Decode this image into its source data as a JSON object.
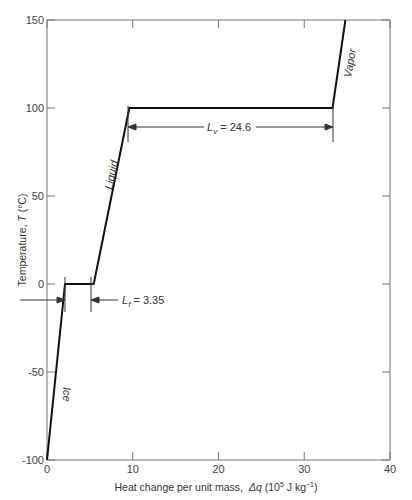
{
  "chart_data": {
    "type": "line",
    "title": "",
    "xlabel": "Heat change per unit mass,  Δq (10⁵ J kg⁻¹)",
    "ylabel": "Temperature, T (°C)",
    "xlim": [
      0,
      40
    ],
    "ylim": [
      -100,
      150
    ],
    "x_ticks": [
      "0",
      "10",
      "20",
      "30",
      "40"
    ],
    "y_ticks": [
      "-100",
      "-50",
      "0",
      "50",
      "100",
      "150"
    ],
    "grid": false,
    "series": [
      {
        "name": "H2O heating curve",
        "x": [
          0,
          2.1,
          5.45,
          9.6,
          33.3,
          34.8
        ],
        "y": [
          -100,
          0,
          0,
          100,
          100,
          150
        ]
      }
    ],
    "annotations": [
      {
        "text": "Ice",
        "phase": "solid"
      },
      {
        "text": "Liquid",
        "phase": "liquid"
      },
      {
        "text": "Vapor",
        "phase": "gas"
      },
      {
        "text": "L_f = 3.35",
        "symbol": "L",
        "subscript": "f",
        "value": "3.35"
      },
      {
        "text": "L_v = 24.6",
        "symbol": "L",
        "subscript": "v",
        "value": "24.6"
      }
    ]
  },
  "labels": {
    "ice": "Ice",
    "liquid": "Liquid",
    "vapor": "Vapor",
    "lf_symbol": "L",
    "lf_sub": "f",
    "lf_value": " = 3.35",
    "lv_symbol": "L",
    "lv_sub": "v",
    "lv_value": " = 24.6",
    "xlabel_text": "Heat change per unit mass,",
    "xlabel_var": "Δq",
    "xlabel_unit_a": " (10",
    "xlabel_unit_exp": "5",
    "xlabel_unit_b": " J kg",
    "xlabel_unit_exp2": "−1",
    "xlabel_unit_c": ")",
    "ylabel_text": "Temperature, ",
    "ylabel_var": "T",
    "ylabel_unit": " (°C)"
  }
}
